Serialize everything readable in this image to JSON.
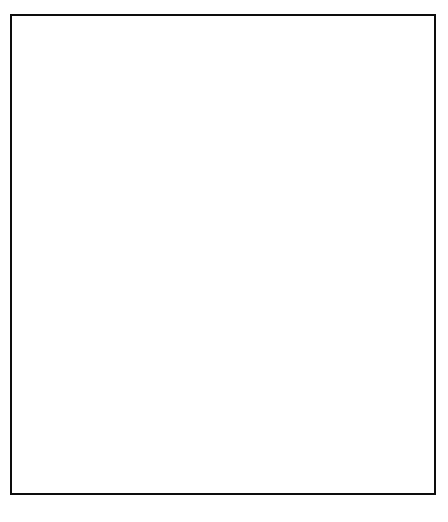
{
  "chart_data": {
    "type": "line",
    "title": "",
    "xlabel": "",
    "ylabel": "Share of Central Government Budget",
    "xlim": [
      1945,
      1965
    ],
    "ylim": [
      0.0,
      0.36
    ],
    "grid": false,
    "legend_position": "top-right",
    "y_ticks": [
      "0.00",
      "0.05",
      "0.10",
      "0.15",
      "0.20",
      "0.25",
      "0.30",
      "0.35"
    ],
    "y_tick_values": [
      0.0,
      0.05,
      0.1,
      0.15,
      0.2,
      0.25,
      0.3,
      0.35
    ],
    "x_ticks": [
      "1945",
      "1947",
      "1949",
      "1951",
      "1953",
      "1955",
      "1957",
      "1959",
      "1961",
      "1963",
      "1965"
    ],
    "x_tick_values": [
      1945,
      1947,
      1949,
      1951,
      1953,
      1955,
      1957,
      1959,
      1961,
      1963,
      1965
    ],
    "x": [
      1945,
      1946,
      1947,
      1948,
      1949,
      1950,
      1951,
      1952,
      1953,
      1954,
      1955,
      1956,
      1957,
      1958,
      1959,
      1960,
      1961,
      1962,
      1963,
      1964,
      1965
    ],
    "series": [
      {
        "name": "Military",
        "style": "solid",
        "color": "#000000",
        "values": [
          0.267,
          0.35,
          0.35,
          0.3,
          0.293,
          0.267,
          0.307,
          0.324,
          0.285,
          0.266,
          0.282,
          0.241,
          0.291,
          0.285,
          0.249,
          0.206,
          0.165,
          0.158,
          0.151,
          0.142,
          0.204
        ]
      },
      {
        "name": "Public Works",
        "style": "dashed",
        "color": "#000000",
        "values": [
          0.185,
          0.148,
          0.186,
          0.166,
          0.156,
          0.157,
          0.192,
          0.178,
          0.205,
          0.22,
          0.219,
          0.128,
          0.178,
          0.288,
          0.248,
          0.215,
          0.205,
          0.211,
          0.213,
          0.272,
          0.23
        ]
      },
      {
        "name": "Education and Health",
        "style": "dashdot",
        "color": "#000000",
        "values": [
          0.079,
          0.082,
          0.085,
          0.087,
          0.089,
          0.092,
          0.095,
          0.103,
          0.108,
          0.104,
          0.098,
          0.065,
          0.086,
          0.099,
          0.1,
          0.099,
          0.089,
          0.096,
          0.083,
          0.083,
          0.113
        ]
      },
      {
        "name": "Agriculture",
        "style": "dotted",
        "color": "#000000",
        "values": [
          0.032,
          0.034,
          0.041,
          0.042,
          0.042,
          0.042,
          0.042,
          0.041,
          0.043,
          0.046,
          0.045,
          0.033,
          0.036,
          0.038,
          0.038,
          0.038,
          0.023,
          0.022,
          0.022,
          0.026,
          0.023
        ]
      }
    ]
  },
  "legend": {
    "items": [
      {
        "label": "Military",
        "style": "solid"
      },
      {
        "label": "Public Works",
        "style": "dashed"
      },
      {
        "label": "Education and Health",
        "style": "dashdot"
      },
      {
        "label": "Agriculture",
        "style": "dotted"
      }
    ]
  },
  "axes": {
    "y_title": "Share of Central Government Budget"
  }
}
